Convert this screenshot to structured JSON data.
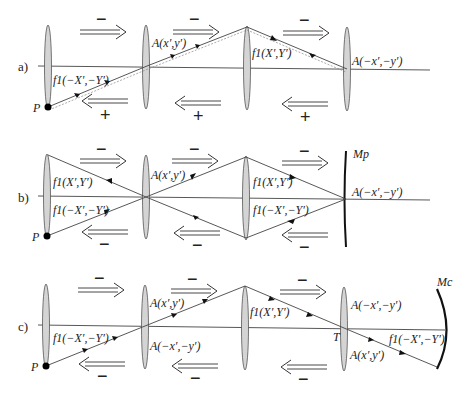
{
  "figure": {
    "panels": [
      {
        "id": "a",
        "label": "a)",
        "source_label": "P",
        "labels": {
          "lens1": "f1(−X′,−Y′)",
          "lens2": "A(x′,y′)",
          "lens3": "f1(X′,Y′)",
          "lens4": "A(−x′,−y′)"
        },
        "forward_signs": [
          "−",
          "−",
          "−"
        ],
        "backward_signs": [
          "+",
          "+",
          "+"
        ]
      },
      {
        "id": "b",
        "label": "b)",
        "source_label": "P",
        "mirror_label": "Mp",
        "labels": {
          "lens1_top": "f1(X′,Y′)",
          "lens1_bottom": "f1(−X′,−Y′)",
          "lens2": "A(x′,y′)",
          "lens3_top": "f1(X′,Y′)",
          "lens3_bottom": "f1(−X′,−Y′)",
          "mirror_point": "A(−x′,−y′)"
        },
        "forward_signs": [
          "−",
          "−",
          "−"
        ],
        "backward_signs": [
          "−",
          "−",
          "−"
        ]
      },
      {
        "id": "c",
        "label": "c)",
        "source_label": "P",
        "mirror_label": "Mc",
        "point_T": "T",
        "labels": {
          "lens1": "f1(−X′,−Y′)",
          "lens2_top": "A(x′,y′)",
          "lens2_bottom": "A(−x′,−y′)",
          "lens3": "f1(X′,Y′)",
          "lens4_top": "A(−x′,−y′)",
          "lens4_bottom": "A(x′,y′)",
          "mirror_side": "f1(−X′,−Y′)"
        },
        "forward_signs": [
          "−",
          "−",
          "−"
        ],
        "backward_signs": [
          "−",
          "−",
          "−"
        ]
      }
    ]
  }
}
